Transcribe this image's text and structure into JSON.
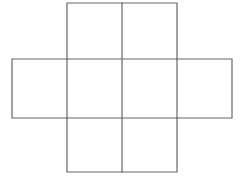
{
  "figure": {
    "name": "cube-net-cross",
    "title": "",
    "background_color": "#ffffff",
    "stroke_color": "#666666",
    "stroke_width": 1.2,
    "fill_color": "none",
    "canvas": {
      "width": 245,
      "height": 180
    },
    "grid": {
      "vertical_line_x": [
        12,
        67,
        122,
        177,
        232
      ],
      "horizontal_line_y": [
        3,
        59,
        118,
        172
      ]
    },
    "cells": [
      {
        "name": "top-square",
        "x": 67,
        "y": 3,
        "width": 55,
        "height": 56
      },
      {
        "name": "top-right-square",
        "x": 122,
        "y": 3,
        "width": 55,
        "height": 56
      },
      {
        "name": "left-square",
        "x": 12,
        "y": 59,
        "width": 55,
        "height": 59
      },
      {
        "name": "center-left-square",
        "x": 67,
        "y": 59,
        "width": 55,
        "height": 59
      },
      {
        "name": "center-right-square",
        "x": 122,
        "y": 59,
        "width": 55,
        "height": 59
      },
      {
        "name": "right-square",
        "x": 177,
        "y": 59,
        "width": 55,
        "height": 59
      },
      {
        "name": "bottom-square",
        "x": 67,
        "y": 118,
        "width": 55,
        "height": 54
      },
      {
        "name": "bottom-right-square",
        "x": 122,
        "y": 118,
        "width": 55,
        "height": 54
      }
    ],
    "outline_path": "M 67 3 L 177 3 L 177 59 L 232 59 L 232 118 L 177 118 L 177 172 L 67 172 L 67 118 L 12 118 L 12 59 L 67 59 Z",
    "inner_segments": [
      {
        "name": "vertical-center-line",
        "x1": 122,
        "y1": 3,
        "x2": 122,
        "y2": 172
      },
      {
        "name": "vertical-left-line",
        "x1": 67,
        "y1": 59,
        "x2": 67,
        "y2": 118
      },
      {
        "name": "vertical-right-line",
        "x1": 177,
        "y1": 59,
        "x2": 177,
        "y2": 118
      },
      {
        "name": "horizontal-upper-line",
        "x1": 67,
        "y1": 59,
        "x2": 177,
        "y2": 59
      },
      {
        "name": "horizontal-lower-line",
        "x1": 67,
        "y1": 118,
        "x2": 177,
        "y2": 118
      }
    ]
  }
}
